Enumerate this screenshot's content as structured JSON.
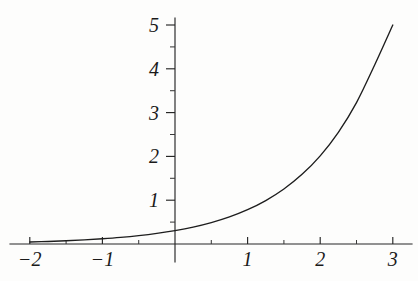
{
  "chart_data": {
    "type": "line",
    "title": "",
    "subtitle": "",
    "xlabel": "",
    "ylabel": "",
    "xlim": [
      -2.15,
      3.15
    ],
    "ylim": [
      -0.2,
      5.2
    ],
    "grid": false,
    "legend": null,
    "annotations": [],
    "x_ticks_major": [
      -2,
      -1,
      0,
      1,
      2,
      3
    ],
    "x_tick_labels": [
      "-2",
      "-1",
      "",
      "1",
      "2",
      "3"
    ],
    "x_ticks_minor": [
      -1.5,
      -0.5,
      0.5,
      1.5,
      2.5
    ],
    "y_ticks_major": [
      1,
      2,
      3,
      4,
      5
    ],
    "y_tick_labels": [
      "1",
      "2",
      "3",
      "4",
      "5"
    ],
    "y_ticks_minor": [
      0.5,
      1.5,
      2.5,
      3.5,
      4.5
    ],
    "series": [
      {
        "name": "exponential",
        "x": [
          -2,
          -1.75,
          -1.5,
          -1.25,
          -1,
          -0.75,
          -0.5,
          -0.25,
          0,
          0.25,
          0.5,
          0.75,
          1,
          1.25,
          1.5,
          1.75,
          2,
          2.25,
          2.5,
          2.75,
          3
        ],
        "values": [
          0.046,
          0.058,
          0.074,
          0.094,
          0.119,
          0.15,
          0.19,
          0.241,
          0.305,
          0.386,
          0.489,
          0.619,
          0.784,
          0.992,
          1.256,
          1.59,
          2.013,
          2.549,
          3.228,
          4.087,
          5.0
        ]
      }
    ],
    "curve_color": "#1d1d1d",
    "axis_color": "#262626",
    "background_color": "#fdfdfc"
  },
  "figure": {
    "name": "exponential-function-graph",
    "caption": ""
  }
}
